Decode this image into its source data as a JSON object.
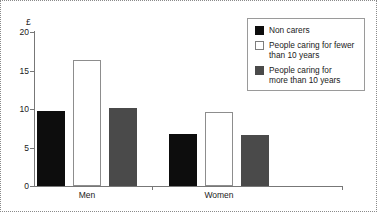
{
  "chart_data": {
    "type": "bar",
    "title": "",
    "subtitle": "",
    "xlabel": "",
    "ylabel": "£",
    "unit_label": "£",
    "ylim": [
      0,
      20
    ],
    "yticks": [
      0,
      5,
      10,
      15,
      20
    ],
    "ytick_labels": [
      "0",
      "5",
      "10",
      "15",
      "20"
    ],
    "grid": false,
    "legend_position": "top-right",
    "categories": [
      "Men",
      "Women"
    ],
    "series": [
      {
        "name": "Non carers",
        "values": [
          9.8,
          6.8
        ],
        "color": "#0d0d0d",
        "style": "black"
      },
      {
        "name": "People caring for fewer\nthan 10 years",
        "values": [
          16.3,
          9.6
        ],
        "color": "#ffffff",
        "style": "white"
      },
      {
        "name": "People caring for\nmore than 10 years",
        "values": [
          10.1,
          6.6
        ],
        "color": "#4a4a4a",
        "style": "gray"
      }
    ]
  },
  "axis": {
    "unit": "£",
    "ticks": [
      {
        "label": "20",
        "value": 20
      },
      {
        "label": "15",
        "value": 15
      },
      {
        "label": "10",
        "value": 10
      },
      {
        "label": "5",
        "value": 5
      },
      {
        "label": "0",
        "value": 0
      }
    ],
    "groups": [
      {
        "label": "Men"
      },
      {
        "label": "Women"
      }
    ]
  },
  "legend": {
    "items": [
      {
        "label": "Non carers",
        "style": "black"
      },
      {
        "label": "People caring for fewer\nthan 10 years",
        "style": "white"
      },
      {
        "label": "People caring for\nmore than 10 years",
        "style": "gray"
      }
    ]
  },
  "colors": {
    "non_carers": "#0d0d0d",
    "fewer_than_10": "#ffffff",
    "more_than_10": "#4a4a4a",
    "axis": "#777777",
    "border": "#8a8a8a"
  }
}
